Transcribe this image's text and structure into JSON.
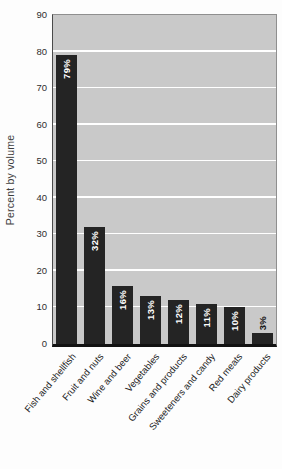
{
  "chart_data": {
    "type": "bar",
    "title": "",
    "xlabel": "",
    "ylabel": "Percent by volume",
    "ylim": [
      0,
      90
    ],
    "yticks": [
      0,
      10,
      20,
      30,
      40,
      50,
      60,
      70,
      80,
      90
    ],
    "grid": "horizontal white gridlines on gray plot background",
    "legend_position": "none",
    "categories": [
      "Fish and shellfish",
      "Fruit and nuts",
      "Wine and beer",
      "Vegetables",
      "Grains and products",
      "Sweeteners and candy",
      "Red meats",
      "Dairy products"
    ],
    "values": [
      79,
      32,
      16,
      13,
      12,
      11,
      10,
      3
    ],
    "value_labels": [
      "79%",
      "32%",
      "16%",
      "13%",
      "12%",
      "11%",
      "10%",
      "3%"
    ],
    "colors": {
      "bar": "#242424",
      "plot_background": "#c9c9c9",
      "gridline": "#ffffff",
      "axis_line": "#121212",
      "frame": "#8f8f8f",
      "value_label_inside": "#ffffff",
      "value_label_outside": "#121212",
      "tick_text": "#2e2e2e"
    }
  }
}
